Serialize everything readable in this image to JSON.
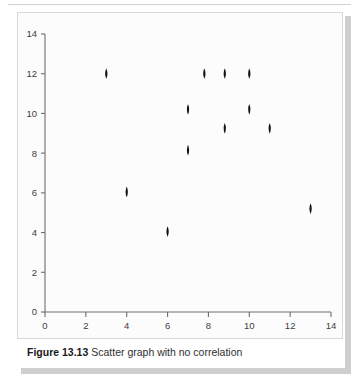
{
  "caption": {
    "number": "Figure 13.13",
    "text": " Scatter graph with no correlation"
  },
  "colors": {
    "marker": "#111111",
    "axis": "#6d6d6d",
    "panel_border": "#d9d9d9",
    "plot_background": "#fcfcfd",
    "tick_text": "#3d3d3d",
    "page_background": "#ffffff",
    "shadow": "#cfcfcf"
  },
  "chart_data": {
    "type": "scatter",
    "title": "Scatter graph with no correlation",
    "xlabel": "",
    "ylabel": "",
    "xlim": [
      0,
      14
    ],
    "ylim": [
      0,
      14
    ],
    "xticks": [
      0,
      2,
      4,
      6,
      8,
      10,
      12,
      14
    ],
    "yticks": [
      0,
      2,
      4,
      6,
      8,
      10,
      12,
      14
    ],
    "xtick_labels": [
      "0",
      "2",
      "4",
      "6",
      "8",
      "10",
      "12",
      "14"
    ],
    "ytick_labels": [
      "0",
      "2",
      "4",
      "6",
      "8",
      "10",
      "12",
      "14"
    ],
    "grid": false,
    "legend": false,
    "marker_shape": "diamond",
    "series": [
      {
        "name": "observations",
        "points": [
          {
            "x": 3.0,
            "y": 12.0
          },
          {
            "x": 4.0,
            "y": 6.05
          },
          {
            "x": 6.0,
            "y": 4.05
          },
          {
            "x": 7.0,
            "y": 10.2
          },
          {
            "x": 7.0,
            "y": 8.15
          },
          {
            "x": 7.8,
            "y": 12.0
          },
          {
            "x": 8.8,
            "y": 12.0
          },
          {
            "x": 8.8,
            "y": 9.25
          },
          {
            "x": 10.0,
            "y": 12.0
          },
          {
            "x": 10.0,
            "y": 10.2
          },
          {
            "x": 11.0,
            "y": 9.25
          },
          {
            "x": 13.0,
            "y": 5.2
          }
        ]
      }
    ]
  }
}
